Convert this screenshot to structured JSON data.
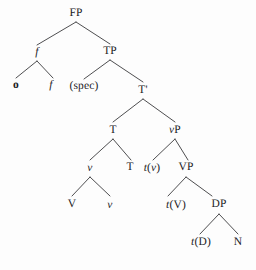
{
  "figure": {
    "kind": "syntax-tree",
    "background_color": "#fdfdfd",
    "line_color": "#3a3a3c",
    "text_color": "#1b1b1d"
  },
  "nodes": [
    {
      "id": "FP",
      "label": "FP",
      "style": "upright",
      "x": 76,
      "y": 14
    },
    {
      "id": "f1",
      "label": "f",
      "style": "italic",
      "x": 37,
      "y": 53
    },
    {
      "id": "TP",
      "label": "TP",
      "style": "upright",
      "x": 110,
      "y": 52
    },
    {
      "id": "o",
      "label": "o",
      "style": "bold",
      "x": 16,
      "y": 86
    },
    {
      "id": "f2",
      "label": "f",
      "style": "italic",
      "x": 51,
      "y": 86
    },
    {
      "id": "spec",
      "label": "(spec)",
      "style": "upright",
      "x": 84,
      "y": 87
    },
    {
      "id": "Tbar",
      "label": "T'",
      "style": "upright",
      "x": 143,
      "y": 91
    },
    {
      "id": "T1",
      "label": "T",
      "style": "upright",
      "x": 113,
      "y": 131
    },
    {
      "id": "vP",
      "label": "vP",
      "style": "mixed-v",
      "x": 175,
      "y": 131
    },
    {
      "id": "v1",
      "label": "v",
      "style": "italic",
      "x": 90,
      "y": 169
    },
    {
      "id": "T2",
      "label": "T",
      "style": "upright",
      "x": 130,
      "y": 168
    },
    {
      "id": "tv",
      "label": "t(v)",
      "style": "trace-v",
      "x": 152,
      "y": 169
    },
    {
      "id": "VP",
      "label": "VP",
      "style": "upright",
      "x": 186,
      "y": 168
    },
    {
      "id": "V",
      "label": "V",
      "style": "upright",
      "x": 72,
      "y": 205
    },
    {
      "id": "v2",
      "label": "v",
      "style": "italic",
      "x": 110,
      "y": 206
    },
    {
      "id": "tV",
      "label": "t(V)",
      "style": "trace-V",
      "x": 176,
      "y": 206
    },
    {
      "id": "DP",
      "label": "DP",
      "style": "upright",
      "x": 219,
      "y": 205
    },
    {
      "id": "tD",
      "label": "t(D)",
      "style": "trace-D",
      "x": 201,
      "y": 243
    },
    {
      "id": "N",
      "label": "N",
      "style": "upright",
      "x": 238,
      "y": 243
    }
  ],
  "node_text_parts": {
    "tv": {
      "italic_prefix": "t",
      "open": "(",
      "inner_italic": "v",
      "close": ")"
    },
    "tV": {
      "italic_prefix": "t",
      "open": "(",
      "inner_upright": "V",
      "close": ")"
    },
    "tD": {
      "italic_prefix": "t",
      "open": "(",
      "inner_upright": "D",
      "close": ")"
    },
    "vP": {
      "italic_prefix": "v",
      "upright_suffix": "P"
    }
  },
  "branches": [
    {
      "parent": "FP",
      "from": [
        76,
        22
      ],
      "to": [
        37,
        45
      ]
    },
    {
      "parent": "FP",
      "from": [
        76,
        22
      ],
      "to": [
        110,
        44
      ]
    },
    {
      "parent": "f1",
      "from": [
        37,
        61
      ],
      "to": [
        16,
        78
      ]
    },
    {
      "parent": "f1",
      "from": [
        37,
        61
      ],
      "to": [
        53,
        78
      ]
    },
    {
      "parent": "TP",
      "from": [
        110,
        60
      ],
      "to": [
        84,
        79
      ]
    },
    {
      "parent": "TP",
      "from": [
        110,
        60
      ],
      "to": [
        143,
        82
      ]
    },
    {
      "parent": "Tbar",
      "from": [
        143,
        99
      ],
      "to": [
        113,
        122
      ]
    },
    {
      "parent": "Tbar",
      "from": [
        143,
        99
      ],
      "to": [
        175,
        122
      ]
    },
    {
      "parent": "T1",
      "from": [
        113,
        139
      ],
      "to": [
        90,
        160
      ]
    },
    {
      "parent": "T1",
      "from": [
        113,
        139
      ],
      "to": [
        131,
        160
      ]
    },
    {
      "parent": "vP",
      "from": [
        175,
        139
      ],
      "to": [
        153,
        160
      ]
    },
    {
      "parent": "vP",
      "from": [
        175,
        139
      ],
      "to": [
        188,
        160
      ]
    },
    {
      "parent": "v1",
      "from": [
        90,
        177
      ],
      "to": [
        72,
        196
      ]
    },
    {
      "parent": "v1",
      "from": [
        90,
        177
      ],
      "to": [
        110,
        196
      ]
    },
    {
      "parent": "VP",
      "from": [
        186,
        177
      ],
      "to": [
        168,
        196
      ]
    },
    {
      "parent": "VP",
      "from": [
        186,
        177
      ],
      "to": [
        212,
        196
      ]
    },
    {
      "parent": "DP",
      "from": [
        219,
        214
      ],
      "to": [
        200,
        234
      ]
    },
    {
      "parent": "DP",
      "from": [
        219,
        214
      ],
      "to": [
        238,
        234
      ]
    }
  ]
}
